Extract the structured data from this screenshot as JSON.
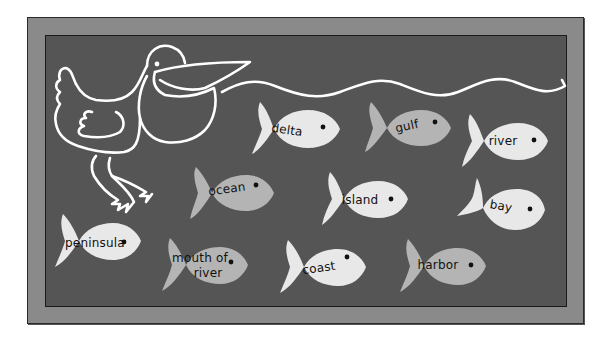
{
  "colors": {
    "page_bg": "#ffffff",
    "board_frame": "#8a8a8a",
    "board_inner": "#555555",
    "line_art": "#ffffff",
    "fish_light": "#e8e8e8",
    "fish_mid": "#b4b4b4",
    "fish_eye": "#111111",
    "label_text": "#111111"
  },
  "board": {
    "illustration": "pelican",
    "water_line": "wavy"
  },
  "fish": [
    {
      "label": "delta",
      "shade": "light"
    },
    {
      "label": "gulf",
      "shade": "mid"
    },
    {
      "label": "river",
      "shade": "light"
    },
    {
      "label": "ocean",
      "shade": "mid"
    },
    {
      "label": "island",
      "shade": "light"
    },
    {
      "label": "bay",
      "shade": "light"
    },
    {
      "label": "peninsula",
      "shade": "light"
    },
    {
      "label": "mouth of",
      "label_line2": "river",
      "shade": "mid"
    },
    {
      "label": "coast",
      "shade": "light"
    },
    {
      "label": "harbor",
      "shade": "mid"
    }
  ]
}
